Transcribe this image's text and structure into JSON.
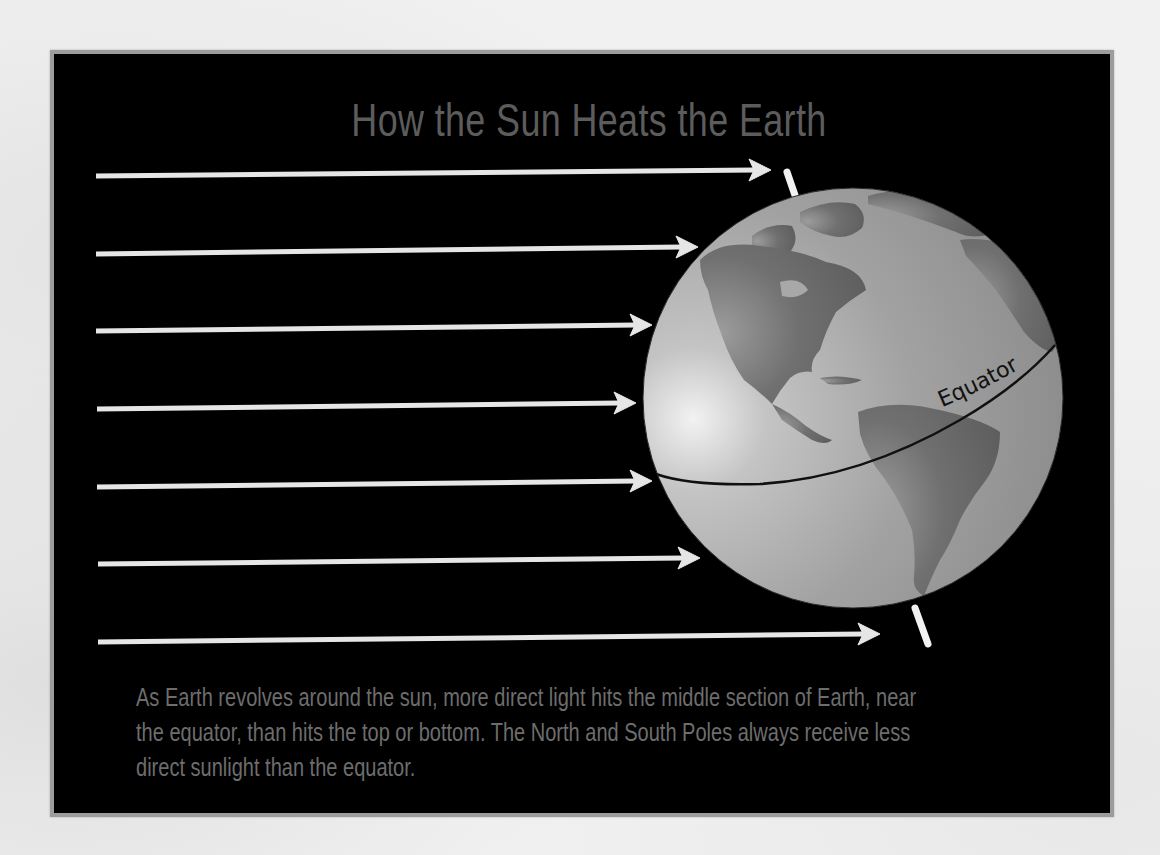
{
  "title": "How the Sun Heats the Earth",
  "caption": {
    "lines": [
      "As Earth revolves around the sun, more direct light hits the middle section of Earth, near",
      "the equator, than hits the top or bottom.  The North and South Poles always receive less",
      "direct sunlight than the equator."
    ]
  },
  "diagram": {
    "equator_label": "Equator",
    "sun_rays": [
      {
        "id": 1,
        "y_start": 176,
        "tip_x": 771,
        "tip_y": 170
      },
      {
        "id": 2,
        "y_start": 254,
        "tip_x": 698,
        "tip_y": 247
      },
      {
        "id": 3,
        "y_start": 331,
        "tip_x": 652,
        "tip_y": 325
      },
      {
        "id": 4,
        "y_start": 409,
        "tip_x": 636,
        "tip_y": 403
      },
      {
        "id": 5,
        "y_start": 487,
        "tip_x": 652,
        "tip_y": 481
      },
      {
        "id": 6,
        "y_start": 564,
        "tip_x": 700,
        "tip_y": 558
      },
      {
        "id": 7,
        "y_start": 642,
        "tip_x": 880,
        "tip_y": 634
      }
    ],
    "globe": {
      "cx": 853,
      "cy": 398,
      "r": 210
    },
    "colors": {
      "panel_background": "#000000",
      "panel_border": "#9c9c9c",
      "ray": "#e6e6e6",
      "ocean": "#9a9a9a",
      "land": "#6a6a6a",
      "equator_line": "#111111",
      "title_text": "#5c5c5c",
      "caption_text": "#6d6d6d"
    }
  }
}
